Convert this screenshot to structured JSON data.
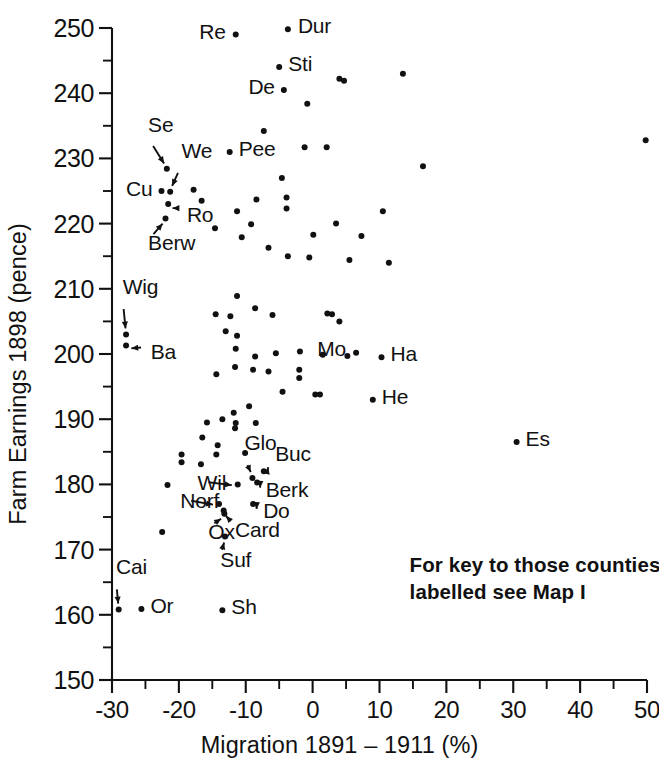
{
  "chart_data": {
    "type": "scatter",
    "title": "",
    "xlabel": "Migration 1891 – 1911 (%)",
    "ylabel": "Farm Earnings 1898 (pence)",
    "xlim": [
      -30,
      50
    ],
    "ylim": [
      150,
      250
    ],
    "grid": false,
    "legend": null,
    "xticks": [
      -30,
      -20,
      -10,
      0,
      10,
      20,
      30,
      40,
      50
    ],
    "xtick_labels": [
      "-30",
      "-20",
      "-10",
      "0",
      "10",
      "20",
      "30",
      "40",
      "50"
    ],
    "xtick_minor_step": 5,
    "yticks": [
      150,
      160,
      170,
      180,
      190,
      200,
      210,
      220,
      230,
      240,
      250
    ],
    "ytick_labels": [
      "150",
      "160",
      "170",
      "180",
      "190",
      "200",
      "210",
      "220",
      "230",
      "240",
      "250"
    ],
    "ytick_minor_step": 5,
    "annotation_lines": [
      "For key to those counties",
      "labelled see Map I"
    ],
    "labelled_points": [
      {
        "label": "Re",
        "x": -11.5,
        "y": 249.0,
        "side": "left"
      },
      {
        "label": "Dur",
        "x": -3.7,
        "y": 249.8,
        "side": "right"
      },
      {
        "label": "Sti",
        "x": -5.0,
        "y": 244.0,
        "side": "right"
      },
      {
        "label": "De",
        "x": -4.3,
        "y": 240.5,
        "side": "left"
      },
      {
        "label": "Pee",
        "x": -12.4,
        "y": 231.0,
        "side": "right"
      },
      {
        "label": "Se",
        "x": -21.8,
        "y": 228.4,
        "side": "leader"
      },
      {
        "label": "We",
        "x": -21.3,
        "y": 224.9,
        "side": "leader"
      },
      {
        "label": "Cu",
        "x": -22.6,
        "y": 225.0,
        "side": "left"
      },
      {
        "label": "Ro",
        "x": -21.6,
        "y": 223.0,
        "side": "leader"
      },
      {
        "label": "Berw",
        "x": -22.0,
        "y": 220.8,
        "side": "leader"
      },
      {
        "label": "Wig",
        "x": -27.9,
        "y": 203.0,
        "side": "leader"
      },
      {
        "label": "Ba",
        "x": -27.9,
        "y": 201.3,
        "side": "leader"
      },
      {
        "label": "Mo",
        "x": 6.5,
        "y": 200.2,
        "side": "right"
      },
      {
        "label": "Ha",
        "x": 10.3,
        "y": 199.5,
        "side": "right"
      },
      {
        "label": "He",
        "x": 9.0,
        "y": 193.0,
        "side": "right"
      },
      {
        "label": "Es",
        "x": 30.5,
        "y": 186.5,
        "side": "right"
      },
      {
        "label": "Glo",
        "x": -9.0,
        "y": 181.0,
        "side": "leader"
      },
      {
        "label": "Buc",
        "x": -7.3,
        "y": 182.0,
        "side": "leader"
      },
      {
        "label": "Wil",
        "x": -11.2,
        "y": 180.0,
        "side": "leader"
      },
      {
        "label": "Berk",
        "x": -8.3,
        "y": 180.3,
        "side": "leader"
      },
      {
        "label": "Norf",
        "x": -14.0,
        "y": 177.0,
        "side": "leader"
      },
      {
        "label": "Do",
        "x": -8.9,
        "y": 177.0,
        "side": "leader"
      },
      {
        "label": "Ox",
        "x": -13.2,
        "y": 175.5,
        "side": "leader"
      },
      {
        "label": "Card",
        "x": -13.3,
        "y": 176.0,
        "side": "leader"
      },
      {
        "label": "Suf",
        "x": -13.1,
        "y": 172.0,
        "side": "leader"
      },
      {
        "label": "Cai",
        "x": -29.0,
        "y": 160.8,
        "side": "leader"
      },
      {
        "label": "Or",
        "x": -25.6,
        "y": 160.9,
        "side": "right"
      },
      {
        "label": "Sh",
        "x": -13.5,
        "y": 160.7,
        "side": "right"
      }
    ],
    "unlabelled_points": [
      {
        "x": 13.5,
        "y": 243.0
      },
      {
        "x": 4.7,
        "y": 241.9
      },
      {
        "x": 4.0,
        "y": 242.2
      },
      {
        "x": -0.8,
        "y": 238.4
      },
      {
        "x": 49.8,
        "y": 232.8
      },
      {
        "x": 16.5,
        "y": 228.8
      },
      {
        "x": -1.2,
        "y": 231.7
      },
      {
        "x": 2.1,
        "y": 231.7
      },
      {
        "x": -7.3,
        "y": 234.2
      },
      {
        "x": -4.6,
        "y": 227.0
      },
      {
        "x": -17.8,
        "y": 225.2
      },
      {
        "x": -11.3,
        "y": 221.9
      },
      {
        "x": -16.6,
        "y": 223.5
      },
      {
        "x": -8.4,
        "y": 223.7
      },
      {
        "x": -3.9,
        "y": 224.0
      },
      {
        "x": -3.9,
        "y": 222.3
      },
      {
        "x": -14.6,
        "y": 219.3
      },
      {
        "x": -9.2,
        "y": 219.9
      },
      {
        "x": -10.6,
        "y": 217.9
      },
      {
        "x": 0.1,
        "y": 218.3
      },
      {
        "x": 7.3,
        "y": 218.1
      },
      {
        "x": 3.5,
        "y": 220.0
      },
      {
        "x": 10.5,
        "y": 221.9
      },
      {
        "x": -6.6,
        "y": 216.3
      },
      {
        "x": -3.7,
        "y": 215.0
      },
      {
        "x": -0.5,
        "y": 214.8
      },
      {
        "x": 5.5,
        "y": 214.4
      },
      {
        "x": 11.4,
        "y": 214.0
      },
      {
        "x": -11.3,
        "y": 208.9
      },
      {
        "x": -8.6,
        "y": 207.0
      },
      {
        "x": -14.5,
        "y": 206.1
      },
      {
        "x": -12.3,
        "y": 205.8
      },
      {
        "x": -6.0,
        "y": 206.0
      },
      {
        "x": 2.2,
        "y": 206.2
      },
      {
        "x": 2.9,
        "y": 206.1
      },
      {
        "x": -13.0,
        "y": 203.5
      },
      {
        "x": -11.3,
        "y": 202.8
      },
      {
        "x": 4.0,
        "y": 205.0
      },
      {
        "x": -11.5,
        "y": 200.8
      },
      {
        "x": -8.6,
        "y": 199.6
      },
      {
        "x": -5.5,
        "y": 200.1
      },
      {
        "x": -1.9,
        "y": 200.4
      },
      {
        "x": 1.5,
        "y": 199.9
      },
      {
        "x": 5.2,
        "y": 199.7
      },
      {
        "x": -11.6,
        "y": 198.0
      },
      {
        "x": -14.4,
        "y": 196.9
      },
      {
        "x": -8.9,
        "y": 197.6
      },
      {
        "x": -6.6,
        "y": 197.3
      },
      {
        "x": -2.0,
        "y": 197.6
      },
      {
        "x": -2.0,
        "y": 196.3
      },
      {
        "x": -4.5,
        "y": 194.2
      },
      {
        "x": 0.4,
        "y": 193.8
      },
      {
        "x": 1.1,
        "y": 193.8
      },
      {
        "x": -9.5,
        "y": 192.0
      },
      {
        "x": -11.8,
        "y": 191.0
      },
      {
        "x": -13.5,
        "y": 190.0
      },
      {
        "x": -11.5,
        "y": 189.4
      },
      {
        "x": -11.6,
        "y": 188.6
      },
      {
        "x": -15.8,
        "y": 189.5
      },
      {
        "x": -8.5,
        "y": 189.4
      },
      {
        "x": -16.5,
        "y": 187.2
      },
      {
        "x": -14.2,
        "y": 186.0
      },
      {
        "x": -14.4,
        "y": 184.6
      },
      {
        "x": -19.6,
        "y": 184.6
      },
      {
        "x": -19.6,
        "y": 183.4
      },
      {
        "x": -16.7,
        "y": 183.1
      },
      {
        "x": -21.7,
        "y": 179.9
      },
      {
        "x": -22.5,
        "y": 172.7
      },
      {
        "x": -10.1,
        "y": 184.8
      }
    ]
  },
  "axis": {
    "x_title": "Migration 1891 – 1911 (%)",
    "y_title": "Farm Earnings 1898 (pence)"
  },
  "key_note": {
    "line1": "For key to those counties",
    "line2": "labelled see Map I"
  }
}
